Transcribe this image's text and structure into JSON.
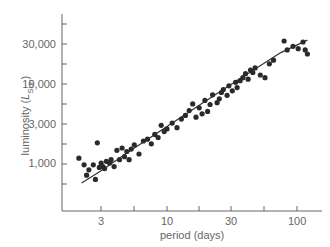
{
  "chart_data": {
    "type": "scatter",
    "title": "",
    "xlabel": "period (days)",
    "ylabel": "luminosity (L_Sun)",
    "ylabel_parts": {
      "main": "luminosity (",
      "italic": "L",
      "sub": "Sun",
      "close": ")"
    },
    "x_scale": "log",
    "y_scale": "log",
    "xlim": [
      1.7,
      140
    ],
    "ylim": [
      300,
      70000
    ],
    "x_ticks": [
      3,
      10,
      30,
      100
    ],
    "x_tick_labels": [
      "3",
      "10",
      "30",
      "100"
    ],
    "y_ticks": [
      1000,
      3000,
      10000,
      30000
    ],
    "y_tick_labels": [
      "1,000",
      "3,000",
      "10,000",
      "30,000"
    ],
    "grid": false,
    "legend": null,
    "point_color": "#2a2a2a",
    "fit_line": {
      "description": "smooth trend curve",
      "points": [
        [
          2.1,
          560
        ],
        [
          3,
          800
        ],
        [
          5,
          1400
        ],
        [
          10,
          2900
        ],
        [
          20,
          6000
        ],
        [
          30,
          9200
        ],
        [
          50,
          15500
        ],
        [
          80,
          25000
        ],
        [
          130,
          36000
        ]
      ]
    },
    "points": [
      [
        2.0,
        1150
      ],
      [
        2.2,
        950
      ],
      [
        2.3,
        700
      ],
      [
        2.4,
        820
      ],
      [
        2.6,
        950
      ],
      [
        2.7,
        620
      ],
      [
        2.8,
        1800
      ],
      [
        2.9,
        880
      ],
      [
        3.0,
        1000
      ],
      [
        3.1,
        900
      ],
      [
        3.2,
        850
      ],
      [
        3.3,
        1050
      ],
      [
        3.5,
        1000
      ],
      [
        3.6,
        1100
      ],
      [
        3.8,
        900
      ],
      [
        4.0,
        1450
      ],
      [
        4.2,
        1100
      ],
      [
        4.4,
        1550
      ],
      [
        4.6,
        1200
      ],
      [
        4.8,
        1400
      ],
      [
        5.0,
        1100
      ],
      [
        5.2,
        1500
      ],
      [
        5.5,
        1700
      ],
      [
        6.0,
        1300
      ],
      [
        6.5,
        1900
      ],
      [
        7.0,
        2000
      ],
      [
        7.5,
        1750
      ],
      [
        8.0,
        2300
      ],
      [
        8.5,
        2100
      ],
      [
        9.0,
        3000
      ],
      [
        9.5,
        2500
      ],
      [
        10.0,
        2700
      ],
      [
        11,
        3200
      ],
      [
        12,
        2800
      ],
      [
        13,
        3600
      ],
      [
        14,
        4000
      ],
      [
        15,
        4600
      ],
      [
        16,
        5600
      ],
      [
        17,
        3800
      ],
      [
        18,
        5000
      ],
      [
        19,
        4200
      ],
      [
        20,
        6200
      ],
      [
        21,
        4500
      ],
      [
        22,
        5500
      ],
      [
        23,
        7300
      ],
      [
        25,
        5800
      ],
      [
        26,
        6500
      ],
      [
        27,
        7800
      ],
      [
        28,
        8500
      ],
      [
        30,
        7200
      ],
      [
        31,
        9500
      ],
      [
        33,
        8200
      ],
      [
        35,
        10500
      ],
      [
        36,
        9000
      ],
      [
        38,
        11000
      ],
      [
        40,
        12000
      ],
      [
        42,
        13500
      ],
      [
        44,
        11500
      ],
      [
        46,
        15000
      ],
      [
        48,
        14000
      ],
      [
        50,
        16000
      ],
      [
        55,
        13000
      ],
      [
        60,
        12000
      ],
      [
        65,
        18000
      ],
      [
        70,
        20000
      ],
      [
        85,
        35000
      ],
      [
        90,
        27000
      ],
      [
        100,
        30000
      ],
      [
        110,
        28000
      ],
      [
        120,
        34000
      ],
      [
        125,
        27000
      ],
      [
        130,
        24000
      ]
    ]
  }
}
